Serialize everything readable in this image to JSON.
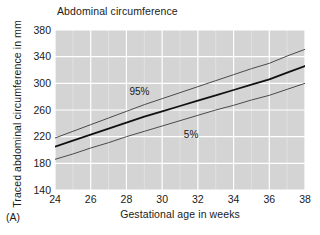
{
  "figure": {
    "panel_label": "(A)",
    "background_color": "#ffffff",
    "plot_background_color": "#d4d4d4",
    "grid_color": "#ffffff"
  },
  "chart_data": {
    "type": "line",
    "title": "Abdominal circumference",
    "xlabel": "Gestational age in weeks",
    "ylabel": "Traced abdominal circumference in mm",
    "xlim": [
      24,
      38
    ],
    "ylim": [
      140,
      380
    ],
    "xticks": [
      24,
      26,
      28,
      30,
      32,
      34,
      36,
      38
    ],
    "yticks": [
      140,
      180,
      220,
      260,
      300,
      340,
      380
    ],
    "xtick_labels": [
      "24",
      "26",
      "28",
      "30",
      "32",
      "34",
      "36",
      "38"
    ],
    "ytick_labels": [
      "140",
      "180",
      "220",
      "260",
      "300",
      "340",
      "380"
    ],
    "grid": true,
    "legend_position": "inline-annotation",
    "x": [
      24,
      25,
      26,
      27,
      28,
      29,
      30,
      31,
      32,
      33,
      34,
      35,
      36,
      37,
      38
    ],
    "series": [
      {
        "name": "95%",
        "label": "95%",
        "color": "#4a4a4a",
        "line_width": 1,
        "values": [
          218,
          228,
          238,
          248,
          258,
          268,
          277,
          286,
          295,
          304,
          313,
          322,
          330,
          341,
          351
        ]
      },
      {
        "name": "50%",
        "label": "",
        "color": "#111111",
        "line_width": 1.8,
        "values": [
          205,
          214,
          223,
          232,
          241,
          250,
          258,
          266,
          274,
          282,
          290,
          298,
          306,
          316,
          326
        ]
      },
      {
        "name": "5%",
        "label": "5%",
        "color": "#4a4a4a",
        "line_width": 1,
        "values": [
          186,
          194,
          203,
          211,
          220,
          228,
          236,
          244,
          252,
          260,
          267,
          275,
          282,
          291,
          300
        ]
      }
    ],
    "annotations": [
      {
        "text": "95%",
        "x": 29.4,
        "y": 287
      },
      {
        "text": "5%",
        "x": 32.0,
        "y": 222
      }
    ]
  }
}
